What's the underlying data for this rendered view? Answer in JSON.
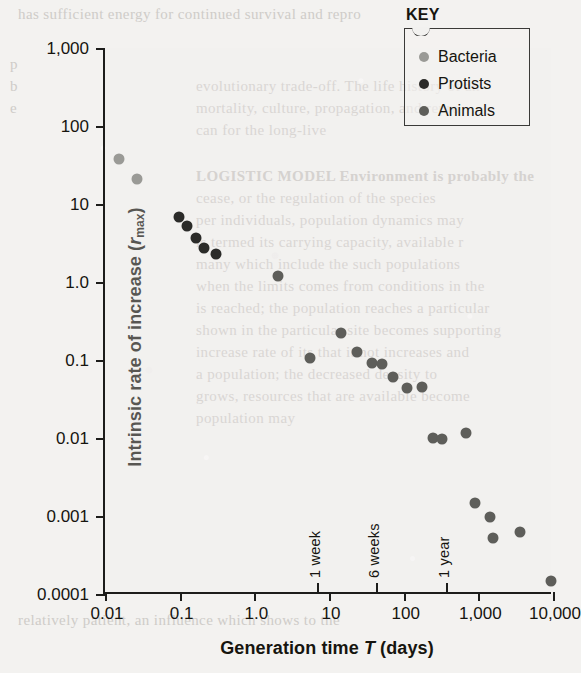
{
  "figure": {
    "key_title": "KEY",
    "y_axis_title_main": "Intrinsic rate of increase (",
    "y_axis_title_symbol": "r",
    "y_axis_title_sub": "max",
    "y_axis_title_close": ")",
    "x_axis_title_pre": "Generation time ",
    "x_axis_title_symbol": "T",
    "x_axis_title_post": " (days)"
  },
  "legend": {
    "items": [
      {
        "label": "Bacteria",
        "color": "#9a9a96"
      },
      {
        "label": "Protists",
        "color": "#2b2b29"
      },
      {
        "label": "Animals",
        "color": "#5e5e5a"
      }
    ]
  },
  "chart_data": {
    "type": "scatter",
    "title": "",
    "xlabel": "Generation time T (days)",
    "ylabel": "Intrinsic rate of increase (rmax)",
    "xscale": "log",
    "yscale": "log",
    "xlim": [
      0.01,
      10000
    ],
    "ylim": [
      0.0001,
      1000
    ],
    "grid": false,
    "legend_position": "top-right",
    "xticks": [
      0.01,
      0.1,
      1.0,
      10,
      100,
      1000,
      10000
    ],
    "xtick_labels": [
      "0.01",
      "0.1",
      "1.0",
      "10",
      "100",
      "1,000",
      "10,000"
    ],
    "yticks": [
      0.0001,
      0.001,
      0.01,
      0.1,
      1.0,
      10,
      100,
      1000
    ],
    "ytick_labels": [
      "0.0001",
      "0.001",
      "0.01",
      "0.1",
      "1.0",
      "10",
      "100",
      "1,000"
    ],
    "annotations": [
      {
        "text": "1 week",
        "x": 7,
        "orientation": "vertical"
      },
      {
        "text": "6 weeks",
        "x": 42,
        "orientation": "vertical"
      },
      {
        "text": "1 year",
        "x": 365,
        "orientation": "vertical"
      }
    ],
    "series": [
      {
        "name": "Bacteria",
        "color": "#9a9a96",
        "points": [
          {
            "x": 0.0155,
            "y": 38
          },
          {
            "x": 0.0265,
            "y": 21
          }
        ]
      },
      {
        "name": "Protists",
        "color": "#2b2b29",
        "points": [
          {
            "x": 0.098,
            "y": 6.8
          },
          {
            "x": 0.125,
            "y": 5.2
          },
          {
            "x": 0.165,
            "y": 3.7
          },
          {
            "x": 0.215,
            "y": 2.7
          },
          {
            "x": 0.31,
            "y": 2.3
          }
        ]
      },
      {
        "name": "Animals",
        "color": "#5e5e5a",
        "points": [
          {
            "x": 2.1,
            "y": 1.2
          },
          {
            "x": 5.6,
            "y": 0.105
          },
          {
            "x": 14.5,
            "y": 0.225
          },
          {
            "x": 24,
            "y": 0.125
          },
          {
            "x": 38,
            "y": 0.092
          },
          {
            "x": 52,
            "y": 0.088
          },
          {
            "x": 72,
            "y": 0.06
          },
          {
            "x": 110,
            "y": 0.044
          },
          {
            "x": 175,
            "y": 0.045
          },
          {
            "x": 245,
            "y": 0.01
          },
          {
            "x": 330,
            "y": 0.0098
          },
          {
            "x": 680,
            "y": 0.0115
          },
          {
            "x": 900,
            "y": 0.00145
          },
          {
            "x": 1550,
            "y": 0.00052
          },
          {
            "x": 1450,
            "y": 0.00098
          },
          {
            "x": 3600,
            "y": 0.00062
          },
          {
            "x": 9300,
            "y": 0.000145
          }
        ]
      }
    ]
  },
  "ghost_text": [
    {
      "text": "has sufficient energy for continued survival and repro",
      "x": 18,
      "y": 6,
      "size": 15,
      "bold": false
    },
    {
      "text": "p",
      "x": 10,
      "y": 56,
      "size": 15,
      "bold": false
    },
    {
      "text": "b",
      "x": 10,
      "y": 78,
      "size": 15,
      "bold": false
    },
    {
      "text": "evolutionary trade-off. The life history of an",
      "x": 196,
      "y": 78,
      "size": 15,
      "bold": false
    },
    {
      "text": "e",
      "x": 10,
      "y": 100,
      "size": 15,
      "bold": false
    },
    {
      "text": "mortality, culture, propagation, and repro",
      "x": 196,
      "y": 100,
      "size": 15,
      "bold": false
    },
    {
      "text": "can for the long-live",
      "x": 196,
      "y": 122,
      "size": 15,
      "bold": false
    },
    {
      "text": "LOGISTIC MODEL Environment is probably the",
      "x": 196,
      "y": 168,
      "size": 15,
      "bold": true
    },
    {
      "text": "cease, or the regulation of the species",
      "x": 196,
      "y": 190,
      "size": 15,
      "bold": false
    },
    {
      "text": "per individuals, population dynamics may",
      "x": 196,
      "y": 212,
      "size": 15,
      "bold": false
    },
    {
      "text": "is termed its carrying capacity, available r",
      "x": 196,
      "y": 234,
      "size": 15,
      "bold": false
    },
    {
      "text": "many which include the such populations",
      "x": 196,
      "y": 256,
      "size": 15,
      "bold": false
    },
    {
      "text": "when the limits comes from conditions in the",
      "x": 196,
      "y": 278,
      "size": 15,
      "bold": false
    },
    {
      "text": "is reached; the population reaches a particular",
      "x": 196,
      "y": 300,
      "size": 15,
      "bold": false
    },
    {
      "text": "shown in the particular site becomes supporting",
      "x": 196,
      "y": 322,
      "size": 15,
      "bold": false
    },
    {
      "text": "increase rate of its that it not increases and",
      "x": 196,
      "y": 344,
      "size": 15,
      "bold": false
    },
    {
      "text": "a population; the decreased density to",
      "x": 196,
      "y": 366,
      "size": 15,
      "bold": false
    },
    {
      "text": "grows, resources that are available become",
      "x": 196,
      "y": 388,
      "size": 15,
      "bold": false
    },
    {
      "text": "population may",
      "x": 196,
      "y": 410,
      "size": 15,
      "bold": false
    },
    {
      "text": "relatively patient, an influence which shows to the",
      "x": 18,
      "y": 612,
      "size": 15,
      "bold": false
    }
  ]
}
